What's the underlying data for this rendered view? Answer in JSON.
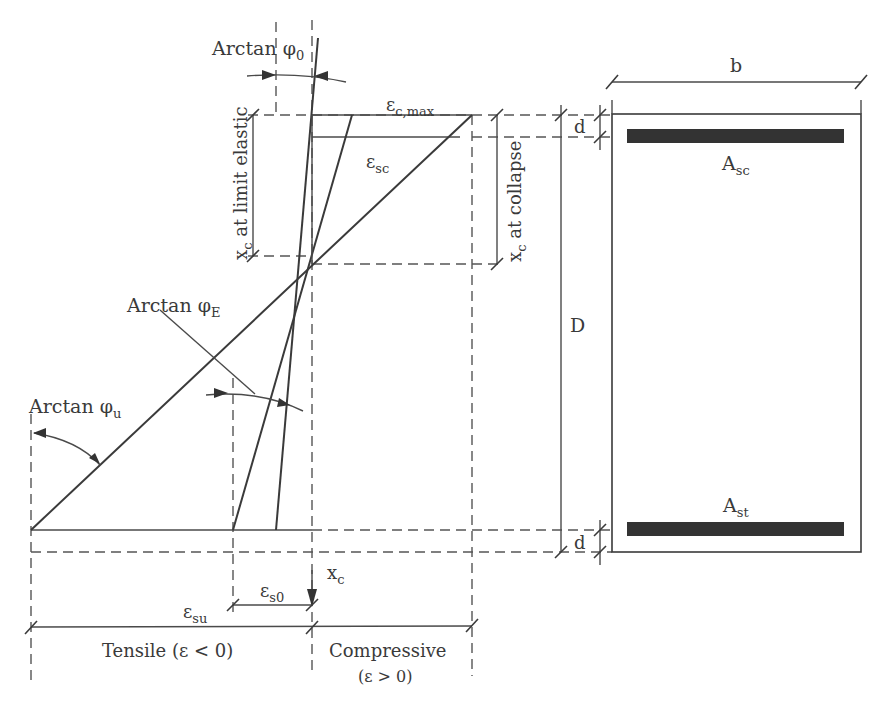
{
  "diagram": {
    "type": "strain-distribution-and-cross-section",
    "strain_diagram": {
      "labels": {
        "arctan_phi0": "Arctan φ",
        "arctan_phi0_sub": "0",
        "arctan_phiE": "Arctan φ",
        "arctan_phiE_sub": "E",
        "arctan_phiu": "Arctan φ",
        "arctan_phiu_sub": "u",
        "eps_cmax": "ε",
        "eps_cmax_sub": "c,max",
        "eps_sc": "ε",
        "eps_sc_sub": "sc",
        "eps_s0": "ε",
        "eps_s0_sub": "s0",
        "eps_su": "ε",
        "eps_su_sub": "su",
        "xc_axis": "x",
        "xc_axis_sub": "c",
        "xc_limit_elastic_prefix": "x",
        "xc_limit_elastic_sub": "c",
        "xc_limit_elastic_rest": " at limit elastic",
        "xc_collapse_prefix": "x",
        "xc_collapse_sub": "c",
        "xc_collapse_rest": " at collapse"
      },
      "axis_regions": {
        "tensile": "Tensile (ε < 0)",
        "compressive": "Compressive",
        "compressive_note": "(ε > 0)"
      }
    },
    "cross_section": {
      "labels": {
        "width": "b",
        "depth": "D",
        "cover_top": "d",
        "cover_bottom": "d",
        "compression_steel": "A",
        "compression_steel_sub": "sc",
        "tension_steel": "A",
        "tension_steel_sub": "st"
      }
    },
    "colors": {
      "line": "#3a3a3a",
      "dashed": "#555555",
      "rebar": "#333333",
      "background": "#ffffff"
    }
  }
}
